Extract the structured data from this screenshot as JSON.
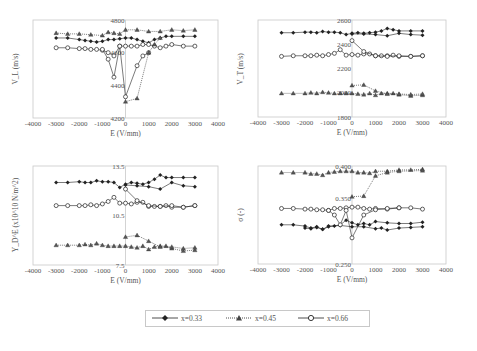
{
  "chart_data": [
    {
      "type": "line",
      "panel": "top-left",
      "xlabel": "E (V/mm)",
      "ylabel": "V_L (m/s)",
      "xlim": [
        -4000,
        4000
      ],
      "ylim": [
        4200,
        4800
      ],
      "xticks": [
        "-4000",
        "-3000",
        "-2000",
        "-1000",
        "0",
        "1000",
        "2000",
        "3000",
        "4000"
      ],
      "yticks": [
        "4200",
        "4400",
        "4600",
        "4800"
      ],
      "series": [
        {
          "name": "x=0.33",
          "marker": "diamond",
          "x": [
            -3000,
            -2500,
            -2000,
            -1750,
            -1500,
            -1250,
            -1000,
            -750,
            -500,
            -250,
            0,
            250,
            500,
            750,
            1000,
            1250,
            1500,
            1750,
            2000,
            2500,
            3000
          ],
          "y": [
            4690,
            4690,
            4680,
            4675,
            4670,
            4665,
            4670,
            4680,
            4680,
            4685,
            4690,
            4690,
            4680,
            4670,
            4660,
            4680,
            4690,
            4700,
            4700,
            4700,
            4700
          ]
        },
        {
          "name": "x=0.45",
          "marker": "triangle",
          "x": [
            -3000,
            -2500,
            -2000,
            -1500,
            -1000,
            -750,
            -500,
            -250,
            0,
            500,
            1000,
            1500,
            2000,
            2500,
            3000
          ],
          "y": [
            4720,
            4715,
            4715,
            4710,
            4705,
            4725,
            4720,
            4715,
            4740,
            4740,
            4730,
            4730,
            4740,
            4735,
            4740
          ]
        },
        {
          "name": "x=0.66",
          "marker": "circle",
          "x": [
            -3000,
            -2500,
            -2000,
            -1750,
            -1500,
            -1250,
            -1000,
            -750,
            -500,
            -250,
            0,
            250,
            500,
            750,
            1000,
            1250,
            1500,
            1750,
            2000,
            2500,
            3000
          ],
          "y": [
            4630,
            4630,
            4625,
            4625,
            4620,
            4620,
            4615,
            4600,
            4580,
            4640,
            4640,
            4640,
            4640,
            4650,
            4650,
            4640,
            4630,
            4640,
            4650,
            4640,
            4640
          ]
        },
        {
          "name": "x=0.66 (branch)",
          "marker": "circle",
          "x": [
            -1000,
            -750,
            -500,
            -250,
            0,
            500,
            750,
            1000
          ],
          "y": [
            4620,
            4560,
            4450,
            4640,
            4330,
            4520,
            4580,
            4600
          ]
        },
        {
          "name": "x=0.45 (branch)",
          "marker": "triangle",
          "x": [
            0,
            500,
            1000,
            1250,
            1500
          ],
          "y": [
            4300,
            4320,
            4600,
            4650,
            4690
          ]
        }
      ]
    },
    {
      "type": "line",
      "panel": "top-right",
      "xlabel": "E (V/mm)",
      "ylabel": "V_T (m/s)",
      "xlim": [
        -4000,
        4000
      ],
      "ylim": [
        1800,
        2600
      ],
      "xticks": [
        "-4000",
        "-3000",
        "-2000",
        "-1000",
        "0",
        "1000",
        "2000",
        "3000",
        "4000"
      ],
      "yticks": [
        "1800",
        "2000",
        "2200",
        "2400",
        "2600"
      ],
      "series": [
        {
          "name": "x=0.33",
          "marker": "diamond",
          "x": [
            -3000,
            -2500,
            -2000,
            -1750,
            -1500,
            -1250,
            -1000,
            -750,
            -500,
            -250,
            0,
            250,
            500,
            750,
            1000,
            1250,
            1500,
            1750,
            2000,
            2500,
            3000
          ],
          "y": [
            2495,
            2495,
            2500,
            2500,
            2495,
            2505,
            2500,
            2500,
            2495,
            2480,
            2490,
            2495,
            2490,
            2495,
            2500,
            2510,
            2530,
            2520,
            2510,
            2510,
            2510
          ]
        },
        {
          "name": "x=0.33 (branch)",
          "marker": "diamond",
          "x": [
            0,
            500,
            1000,
            1500,
            2000,
            2500,
            3000
          ],
          "y": [
            2485,
            2485,
            2480,
            2470,
            2490,
            2480,
            2475
          ]
        },
        {
          "name": "x=0.45",
          "marker": "triangle",
          "x": [
            -3000,
            -2500,
            -2000,
            -1750,
            -1500,
            -1250,
            -1000,
            -750,
            -500,
            -250,
            0,
            250,
            500,
            750,
            1000,
            1250,
            1500,
            1750,
            2000,
            2500,
            3000
          ],
          "y": [
            1995,
            1995,
            1995,
            2000,
            1995,
            2005,
            2000,
            1995,
            1995,
            1995,
            1995,
            1990,
            1985,
            1995,
            1980,
            1995,
            1995,
            1995,
            1985,
            1975,
            1980
          ]
        },
        {
          "name": "x=0.45 (branch)",
          "marker": "triangle",
          "x": [
            0,
            500,
            1000,
            1500,
            2000,
            2500,
            3000
          ],
          "y": [
            2060,
            2065,
            2015,
            1990,
            1990,
            1985,
            1990
          ]
        },
        {
          "name": "x=0.66",
          "marker": "circle",
          "x": [
            -3000,
            -2500,
            -2000,
            -1750,
            -1500,
            -1250,
            -1000,
            -750,
            -500,
            -250,
            0,
            250,
            500,
            750,
            1000,
            1250,
            1500,
            1750,
            2000,
            2500,
            3000
          ],
          "y": [
            2300,
            2305,
            2305,
            2305,
            2310,
            2305,
            2315,
            2325,
            2355,
            2310,
            2315,
            2310,
            2320,
            2320,
            2305,
            2305,
            2305,
            2310,
            2300,
            2300,
            2305
          ]
        },
        {
          "name": "x=0.66 (branch)",
          "marker": "circle",
          "x": [
            0,
            500,
            1000,
            1500,
            2000,
            2500,
            3000
          ],
          "y": [
            2430,
            2340,
            2305,
            2300,
            2305,
            2300,
            2305
          ]
        }
      ]
    },
    {
      "type": "line",
      "panel": "bottom-left",
      "xlabel": "E (V/mm)",
      "ylabel": "Y_D^E (x10^10 N/m^2)",
      "xlim": [
        -4000,
        4000
      ],
      "ylim": [
        7.5,
        13.5
      ],
      "xticks": [
        "-4000",
        "-3000",
        "-2000",
        "-1000",
        "0",
        "1000",
        "2000",
        "3000",
        "4000"
      ],
      "yticks": [
        "7.5",
        "10.5",
        "13.5"
      ],
      "series": [
        {
          "name": "x=0.33",
          "marker": "diamond",
          "x": [
            -3000,
            -2500,
            -2000,
            -1750,
            -1500,
            -1250,
            -1000,
            -750,
            -500,
            -250,
            0,
            250,
            500,
            750,
            1000,
            1250,
            1500,
            1750,
            2000,
            2500,
            3000
          ],
          "y": [
            12.5,
            12.5,
            12.55,
            12.5,
            12.5,
            12.6,
            12.55,
            12.55,
            12.5,
            12.2,
            12.4,
            12.5,
            12.45,
            12.4,
            12.5,
            12.7,
            12.95,
            12.8,
            12.8,
            12.8,
            12.8
          ]
        },
        {
          "name": "x=0.33 (branch)",
          "marker": "diamond",
          "x": [
            0,
            500,
            1000,
            1500,
            2000,
            2500,
            3000
          ],
          "y": [
            12.35,
            12.3,
            12.25,
            12.1,
            12.5,
            12.3,
            12.25
          ]
        },
        {
          "name": "x=0.45",
          "marker": "triangle",
          "x": [
            -3000,
            -2500,
            -2000,
            -1750,
            -1500,
            -1250,
            -1000,
            -750,
            -500,
            -250,
            0,
            250,
            500,
            750,
            1000,
            1250,
            1500,
            1750,
            2000,
            2500,
            3000
          ],
          "y": [
            8.7,
            8.7,
            8.7,
            8.75,
            8.7,
            8.8,
            8.7,
            8.65,
            8.65,
            8.65,
            8.65,
            8.6,
            8.55,
            8.65,
            8.45,
            8.6,
            8.65,
            8.65,
            8.5,
            8.35,
            8.4
          ]
        },
        {
          "name": "x=0.45 (branch)",
          "marker": "triangle",
          "x": [
            0,
            500,
            1000,
            1500,
            2000,
            2500,
            3000
          ],
          "y": [
            9.2,
            9.3,
            8.95,
            8.6,
            8.6,
            8.5,
            8.55
          ]
        },
        {
          "name": "x=0.66",
          "marker": "circle",
          "x": [
            -3000,
            -2500,
            -2000,
            -1750,
            -1500,
            -1250,
            -1000,
            -750,
            -500,
            -250,
            0,
            250,
            500,
            750,
            1000,
            1250,
            1500,
            1750,
            2000,
            2500,
            3000
          ],
          "y": [
            11.1,
            11.1,
            11.1,
            11.1,
            11.15,
            11.1,
            11.2,
            11.35,
            11.6,
            11.25,
            11.25,
            11.2,
            11.3,
            11.3,
            11.05,
            11.05,
            11.05,
            11.1,
            11.0,
            11.0,
            11.1
          ]
        },
        {
          "name": "x=0.66 (branch)",
          "marker": "circle",
          "x": [
            0,
            500,
            1000,
            1500,
            2000,
            2500,
            3000
          ],
          "y": [
            12.1,
            11.4,
            11.1,
            11.05,
            11.1,
            11.0,
            11.1
          ]
        }
      ]
    },
    {
      "type": "line",
      "panel": "bottom-right",
      "xlabel": "E (V/mm)",
      "ylabel": "σ (-)",
      "xlim": [
        -4000,
        4000
      ],
      "ylim": [
        0.25,
        0.4
      ],
      "xticks": [
        "-4000",
        "-3000",
        "-2000",
        "-1000",
        "0",
        "1000",
        "2000",
        "3000",
        "4000"
      ],
      "yticks": [
        "0.250",
        "0.350",
        "0.400"
      ],
      "series": [
        {
          "name": "x=0.33",
          "marker": "diamond",
          "x": [
            -3000,
            -2500,
            -2000,
            -1750,
            -1500,
            -1250,
            -1000,
            -750,
            -500,
            -250,
            0,
            250,
            500,
            750,
            1000,
            1500,
            2000,
            2500,
            3000
          ],
          "y": [
            0.31,
            0.31,
            0.308,
            0.305,
            0.307,
            0.303,
            0.307,
            0.308,
            0.31,
            0.317,
            0.313,
            0.31,
            0.312,
            0.31,
            0.315,
            0.313,
            0.312,
            0.312,
            0.314
          ]
        },
        {
          "name": "x=0.33 (branch)",
          "marker": "diamond",
          "x": [
            -2000,
            -1750,
            -1500,
            -1250,
            -1000,
            -500,
            0,
            500,
            1000,
            1250,
            1500,
            2000,
            2500,
            3000
          ],
          "y": [
            0.305,
            0.304,
            0.306,
            0.303,
            0.308,
            0.309,
            0.307,
            0.307,
            0.304,
            0.305,
            0.302,
            0.305,
            0.306,
            0.307
          ]
        },
        {
          "name": "x=0.45",
          "marker": "triangle",
          "x": [
            -3000,
            -2500,
            -2000,
            -1750,
            -1500,
            -1250,
            -1000,
            -750,
            -500,
            -250,
            0,
            250,
            500,
            750,
            1000,
            1500,
            2000,
            2500,
            3000
          ],
          "y": [
            0.39,
            0.39,
            0.39,
            0.388,
            0.388,
            0.386,
            0.39,
            0.391,
            0.392,
            0.392,
            0.392,
            0.39,
            0.39,
            0.389,
            0.392,
            0.392,
            0.394,
            0.394,
            0.395
          ]
        },
        {
          "name": "x=0.45 (branch)",
          "marker": "triangle",
          "x": [
            0,
            500,
            1000,
            1500,
            2000,
            3000
          ],
          "y": [
            0.353,
            0.354,
            0.385,
            0.39,
            0.392,
            0.393
          ]
        },
        {
          "name": "x=0.66",
          "marker": "circle",
          "x": [
            -3000,
            -2500,
            -2000,
            -1750,
            -1500,
            -1250,
            -1000,
            -750,
            -500,
            -250,
            0,
            250,
            500,
            750,
            1000,
            1500,
            2000,
            2500,
            3000
          ],
          "y": [
            0.335,
            0.335,
            0.334,
            0.334,
            0.333,
            0.333,
            0.332,
            0.335,
            0.335,
            0.336,
            0.337,
            0.337,
            0.335,
            0.334,
            0.335,
            0.334,
            0.336,
            0.336,
            0.334
          ]
        },
        {
          "name": "x=0.66 (branch)",
          "marker": "circle",
          "x": [
            -1000,
            -750,
            -500,
            -250,
            0,
            500,
            1000,
            1500,
            2000
          ],
          "y": [
            0.332,
            0.325,
            0.31,
            0.332,
            0.29,
            0.325,
            0.333,
            0.335,
            0.336
          ]
        }
      ]
    }
  ],
  "legend": {
    "items": [
      {
        "label": "x=0.33",
        "marker": "diamond",
        "style": "solid"
      },
      {
        "label": "x=0.45",
        "marker": "triangle",
        "style": "dotted"
      },
      {
        "label": "x=0.66",
        "marker": "circle",
        "style": "solid"
      }
    ]
  },
  "colors": {
    "series": "#222222",
    "axis": "#c8c8c8",
    "text": "#555555"
  }
}
